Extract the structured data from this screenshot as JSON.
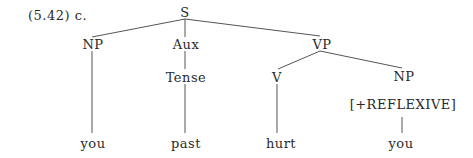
{
  "example_label": "(5.42) c.",
  "tree": {
    "nodes": {
      "S": "S",
      "NP_subj": "NP",
      "Aux": "Aux",
      "VP": "VP",
      "Tense": "Tense",
      "V": "V",
      "NP_obj": "NP",
      "feature": "[+REFLEXIVE]",
      "leaf_you_subj": "you",
      "leaf_past": "past",
      "leaf_hurt": "hurt",
      "leaf_you_obj": "you"
    },
    "edges": [
      [
        "S",
        "NP_subj"
      ],
      [
        "S",
        "Aux"
      ],
      [
        "S",
        "VP"
      ],
      [
        "NP_subj",
        "leaf_you_subj"
      ],
      [
        "Aux",
        "Tense"
      ],
      [
        "Tense",
        "leaf_past"
      ],
      [
        "VP",
        "V"
      ],
      [
        "VP",
        "NP_obj"
      ],
      [
        "V",
        "leaf_hurt"
      ],
      [
        "feature",
        "leaf_you_obj"
      ]
    ]
  }
}
